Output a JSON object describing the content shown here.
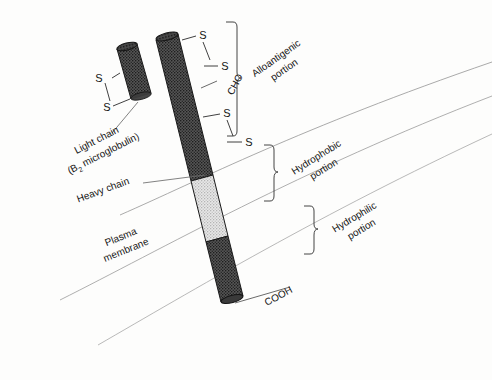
{
  "figure": {
    "background_color": "#fdfdfc",
    "ink_color": "#151515"
  },
  "labels": {
    "light_chain_line1": "Light chain",
    "light_chain_line2": "(B",
    "light_chain_sub": "2",
    "light_chain_line2b": " microglobulin)",
    "heavy_chain": "Heavy chain",
    "plasma_membrane_line1": "Plasma",
    "plasma_membrane_line2": "membrane",
    "cho": "CHO",
    "cooh": "COOH",
    "sulfur": "S"
  },
  "brackets": [
    {
      "name": "alloantigenic",
      "line1": "Alloantigenic",
      "line2": "portion"
    },
    {
      "name": "hydrophobic",
      "line1": "Hydrophobic",
      "line2": "portion"
    },
    {
      "name": "hydrophilic",
      "line1": "Hydrophilic",
      "line2": "portion"
    }
  ],
  "disulfide_bonds": [
    {
      "name": "light-chain-bond",
      "top_label": "S",
      "bottom_label": "S"
    },
    {
      "name": "heavy-chain-bond-upper",
      "top_label": "S",
      "bottom_label": "S"
    },
    {
      "name": "heavy-chain-bond-lower",
      "top_label": "S",
      "bottom_label": "S"
    }
  ],
  "chain_segments": [
    {
      "name": "extracellular-segment",
      "shade": "#4a4a4a",
      "region": "alloantigenic"
    },
    {
      "name": "transmembrane-segment",
      "shade": "#d8d8d8",
      "region": "hydrophobic"
    },
    {
      "name": "cytoplasmic-segment",
      "shade": "#4a4a4a",
      "region": "hydrophilic"
    }
  ],
  "colors": {
    "dark_fill": "#4a4a4a",
    "light_fill": "#d8d8d8",
    "cap_dark": "#3a3a3a",
    "membrane_line": "#8a8a8a",
    "leader_line": "#6b6b6b"
  }
}
